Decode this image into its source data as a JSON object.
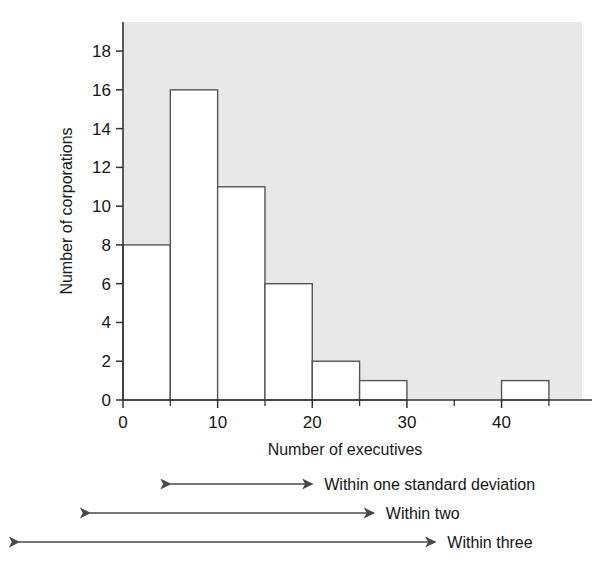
{
  "chart_data": {
    "type": "bar",
    "title": "",
    "subtitle": "",
    "xlabel": "Number of executives",
    "ylabel": "Number of corporations",
    "xlim": [
      0,
      48.5
    ],
    "ylim": [
      0,
      19.5
    ],
    "grid": false,
    "legend_position": "none",
    "bin_width": 5,
    "bin_edges": [
      0,
      5,
      10,
      15,
      20,
      25,
      30,
      35,
      40,
      45
    ],
    "categories": [
      "0-5",
      "5-10",
      "10-15",
      "15-20",
      "20-25",
      "25-30",
      "30-35",
      "35-40",
      "40-45"
    ],
    "values": [
      8,
      16,
      11,
      6,
      2,
      1,
      0,
      0,
      1
    ],
    "x_ticks_major": [
      0,
      10,
      20,
      30,
      40
    ],
    "x_tick_labels": [
      "0",
      "10",
      "20",
      "30",
      "40"
    ],
    "x_ticks_minor": [
      5,
      15,
      25,
      35,
      45
    ],
    "y_ticks": [
      0,
      2,
      4,
      6,
      8,
      10,
      12,
      14,
      16,
      18
    ],
    "y_tick_labels": [
      "0",
      "2",
      "4",
      "6",
      "8",
      "10",
      "12",
      "14",
      "16",
      "18"
    ],
    "plot_background_color": "#e8e8e8",
    "bar_fill_color": "#ffffff",
    "bar_edge_color": "#555555",
    "axis_color": "#333333",
    "annotations": [
      {
        "label": "Within one standard deviation",
        "x_start": 5.0,
        "x_end": 20.0,
        "row": 0
      },
      {
        "label": "Within two",
        "x_start": -3.5,
        "x_end": 26.5,
        "row": 1
      },
      {
        "label": "Within three",
        "x_start": -11.0,
        "x_end": 33.0,
        "row": 2
      }
    ]
  },
  "axes": {
    "y_axis_title": "Number of corporations",
    "x_axis_title": "Number of executives",
    "x_tick_labels": [
      "0",
      "10",
      "20",
      "30",
      "40"
    ],
    "y_tick_labels": [
      "0",
      "2",
      "4",
      "6",
      "8",
      "10",
      "12",
      "14",
      "16",
      "18"
    ]
  },
  "annotations": {
    "row0_label": "Within one standard deviation",
    "row1_label": "Within two",
    "row2_label": "Within three"
  },
  "colors": {
    "plot_background": "#e8e8e8",
    "bar_fill": "#ffffff",
    "bar_edge": "#555555",
    "axis": "#333333",
    "text": "#1a1a1a",
    "arrow": "#4a4a4a"
  }
}
